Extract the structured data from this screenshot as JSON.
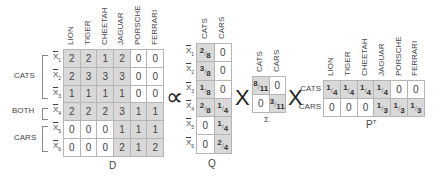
{
  "D": {
    "label": "D",
    "columns": [
      "LION",
      "TIGER",
      "CHEETAH",
      "JAGUAR",
      "PORSCHE",
      "FERRARI"
    ],
    "rows": [
      {
        "label": "X",
        "sub": "1",
        "values": [
          "2",
          "2",
          "1",
          "2",
          "0",
          "0"
        ],
        "shaded": [
          1,
          1,
          1,
          1,
          0,
          0
        ]
      },
      {
        "label": "X",
        "sub": "2",
        "values": [
          "2",
          "3",
          "3",
          "3",
          "0",
          "0"
        ],
        "shaded": [
          1,
          1,
          1,
          1,
          0,
          0
        ]
      },
      {
        "label": "X",
        "sub": "3",
        "values": [
          "1",
          "1",
          "1",
          "1",
          "0",
          "0"
        ],
        "shaded": [
          1,
          1,
          1,
          1,
          0,
          0
        ]
      },
      {
        "label": "X",
        "sub": "4",
        "values": [
          "2",
          "2",
          "2",
          "3",
          "1",
          "1"
        ],
        "shaded": [
          1,
          1,
          1,
          1,
          1,
          1
        ]
      },
      {
        "label": "X",
        "sub": "5",
        "values": [
          "0",
          "0",
          "0",
          "1",
          "1",
          "1"
        ],
        "shaded": [
          0,
          0,
          0,
          1,
          1,
          1
        ]
      },
      {
        "label": "X",
        "sub": "6",
        "values": [
          "0",
          "0",
          "0",
          "2",
          "1",
          "2"
        ],
        "shaded": [
          0,
          0,
          0,
          1,
          1,
          1
        ]
      }
    ],
    "groups": [
      {
        "label": "CATS",
        "rows": [
          1,
          2,
          3
        ]
      },
      {
        "label": "BOTH",
        "rows": [
          4
        ]
      },
      {
        "label": "CARS",
        "rows": [
          5,
          6
        ]
      }
    ]
  },
  "operators": {
    "proportional": "∝",
    "times1": "X",
    "times2": "X"
  },
  "Q": {
    "label": "Q",
    "columns": [
      "CATS",
      "CARS"
    ],
    "rows": [
      {
        "label": "X",
        "sub": "1",
        "values": [
          {
            "n": "2",
            "d": "8"
          },
          "0"
        ],
        "shaded": [
          1,
          0
        ]
      },
      {
        "label": "X",
        "sub": "2",
        "values": [
          {
            "n": "3",
            "d": "8"
          },
          "0"
        ],
        "shaded": [
          1,
          0
        ]
      },
      {
        "label": "X",
        "sub": "3",
        "values": [
          {
            "n": "1",
            "d": "8"
          },
          "0"
        ],
        "shaded": [
          1,
          0
        ]
      },
      {
        "label": "X",
        "sub": "4",
        "values": [
          {
            "n": "2",
            "d": "8"
          },
          {
            "n": "1",
            "d": "4"
          }
        ],
        "shaded": [
          1,
          1
        ]
      },
      {
        "label": "X",
        "sub": "5",
        "values": [
          "0",
          {
            "n": "1",
            "d": "4"
          }
        ],
        "shaded": [
          0,
          1
        ]
      },
      {
        "label": "X",
        "sub": "6",
        "values": [
          "0",
          {
            "n": "2",
            "d": "4"
          }
        ],
        "shaded": [
          0,
          1
        ]
      }
    ]
  },
  "Sigma": {
    "label": "Σ",
    "columns": [
      "CATS",
      "CARS"
    ],
    "rows": [
      {
        "values": [
          {
            "n": "8",
            "d": "11"
          },
          "0"
        ],
        "shaded": [
          1,
          0
        ]
      },
      {
        "values": [
          "0",
          {
            "n": "3",
            "d": "11"
          }
        ],
        "shaded": [
          0,
          1
        ]
      }
    ]
  },
  "PT": {
    "label": "P",
    "label_sup": "T",
    "columns": [
      "LION",
      "TIGER",
      "CHEETAH",
      "JAGUAR",
      "PORSCHE",
      "FERRARI"
    ],
    "rows": [
      {
        "label": "CATS",
        "values": [
          {
            "n": "1",
            "d": "4"
          },
          {
            "n": "1",
            "d": "4"
          },
          {
            "n": "1",
            "d": "4"
          },
          {
            "n": "1",
            "d": "4"
          },
          "0",
          "0"
        ],
        "shaded": [
          1,
          1,
          1,
          1,
          0,
          0
        ]
      },
      {
        "label": "CARS",
        "values": [
          "0",
          "0",
          "0",
          {
            "n": "1",
            "d": "3"
          },
          {
            "n": "1",
            "d": "3"
          },
          {
            "n": "1",
            "d": "3"
          }
        ],
        "shaded": [
          0,
          0,
          0,
          1,
          1,
          1
        ]
      }
    ]
  }
}
